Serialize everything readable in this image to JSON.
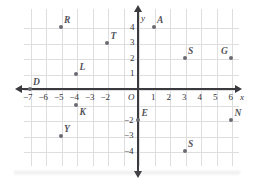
{
  "figure": {
    "type": "coordinate-plane",
    "axis_labels": {
      "x": "x",
      "y": "y",
      "origin": "O"
    },
    "colors": {
      "grid": "#dededf",
      "axis": "#3a3a3f",
      "point": "#6b6b73",
      "label": "#55555c",
      "background": "#ffffff"
    }
  },
  "chart_data": {
    "type": "scatter",
    "title": "",
    "xlabel": "x",
    "ylabel": "y",
    "xlim": [
      -7.6,
      6.8
    ],
    "ylim": [
      -4.8,
      4.8
    ],
    "grid": true,
    "legend": "none",
    "x_ticks": [
      -7,
      -6,
      -5,
      -4,
      -3,
      -2,
      1,
      2,
      3,
      4,
      5,
      6
    ],
    "x_tick_labels": [
      "−7",
      "−6",
      "−5",
      "−4",
      "−3",
      "−2",
      "1",
      "2",
      "3",
      "4",
      "5",
      "6"
    ],
    "y_ticks": [
      4,
      3,
      2,
      1,
      -2,
      -3,
      -4
    ],
    "y_tick_labels": [
      "4",
      "3",
      "2",
      "1",
      "−2",
      "−3",
      "−4"
    ],
    "origin_label": "O",
    "points": [
      {
        "label": "R",
        "x": -5,
        "y": 4,
        "label_pos": "up-right"
      },
      {
        "label": "T",
        "x": -2,
        "y": 3,
        "label_pos": "up-right"
      },
      {
        "label": "L",
        "x": -4,
        "y": 1,
        "label_pos": "up-right"
      },
      {
        "label": "D",
        "x": -7,
        "y": 0,
        "label_pos": "up-right"
      },
      {
        "label": "K",
        "x": -4,
        "y": -1,
        "label_pos": "down-right"
      },
      {
        "label": "Y",
        "x": -5,
        "y": -3,
        "label_pos": "up-right"
      },
      {
        "label": "A",
        "x": 1,
        "y": 4,
        "label_pos": "up-right"
      },
      {
        "label": "S",
        "x": 3,
        "y": 2,
        "label_pos": "up-right"
      },
      {
        "label": "G",
        "x": 6,
        "y": 2,
        "label_pos": "up-left"
      },
      {
        "label": "E",
        "x": 0,
        "y": -2,
        "label_pos": "up-right"
      },
      {
        "label": "N",
        "x": 6,
        "y": -2,
        "label_pos": "up-right"
      },
      {
        "label": "S",
        "x": 3,
        "y": -4,
        "label_pos": "up-right"
      }
    ]
  }
}
